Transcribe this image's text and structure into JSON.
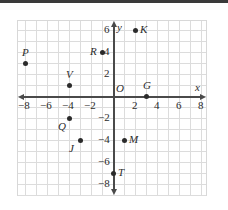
{
  "chart_data": {
    "type": "scatter",
    "title": "",
    "xlabel": "x",
    "ylabel": "y",
    "xlim": [
      -9,
      9
    ],
    "ylim": [
      -9,
      9
    ],
    "grid": true,
    "legend": "none",
    "origin_label": "O",
    "xticks": [
      -8,
      -6,
      -4,
      -2,
      2,
      4,
      6,
      8
    ],
    "yticks": [
      6,
      4,
      2,
      -2,
      -4,
      -6,
      -8
    ],
    "xtick_labels": [
      "−8",
      "−6",
      "−4",
      "−2",
      "2",
      "4",
      "6",
      "8"
    ],
    "ytick_labels": [
      "6",
      "4",
      "2",
      "−2",
      "−4",
      "−6",
      "−8"
    ],
    "points": [
      {
        "label": "K",
        "x": 2,
        "y": 6,
        "label_pos": "right"
      },
      {
        "label": "P",
        "x": -8,
        "y": 3,
        "label_pos": "above"
      },
      {
        "label": "R",
        "x": -1,
        "y": 4,
        "label_pos": "left"
      },
      {
        "label": "V",
        "x": -4,
        "y": 1,
        "label_pos": "above"
      },
      {
        "label": "G",
        "x": 3,
        "y": 0,
        "label_pos": "above"
      },
      {
        "label": "Q",
        "x": -4,
        "y": -2,
        "label_pos": "below-left"
      },
      {
        "label": "J",
        "x": -3,
        "y": -4,
        "label_pos": "below-left"
      },
      {
        "label": "M",
        "x": 1,
        "y": -4,
        "label_pos": "right"
      },
      {
        "label": "T",
        "x": 0,
        "y": -7,
        "label_pos": "right"
      }
    ]
  },
  "colors": {
    "axis": "#4a4a4a",
    "grid": "#dcdcdc",
    "point": "#2b2b2b",
    "text": "#2b2b2b",
    "background": "#ffffff"
  }
}
